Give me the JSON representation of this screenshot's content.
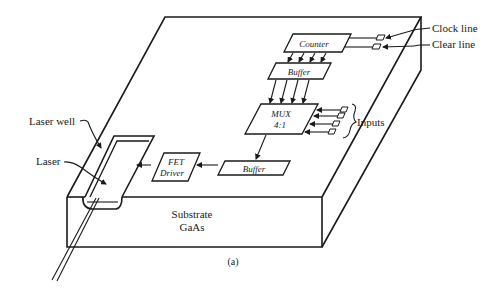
{
  "diagram": {
    "caption": "(a)",
    "substrate": {
      "line1": "Substrate",
      "line2": "GaAs"
    },
    "blocks": {
      "counter": "Counter",
      "buffer_top": "Buffer",
      "mux_line1": "MUX",
      "mux_line2": "4:1",
      "buffer_bottom": "Buffer",
      "fet_line1": "FET",
      "fet_line2": "Driver"
    },
    "labels": {
      "clock_line": "Clock line",
      "clear_line": "Clear line",
      "inputs": "Inputs",
      "laser_well": "Laser well",
      "laser": "Laser"
    },
    "colors": {
      "ink": "#1a1a1a",
      "background": "#ffffff"
    }
  }
}
